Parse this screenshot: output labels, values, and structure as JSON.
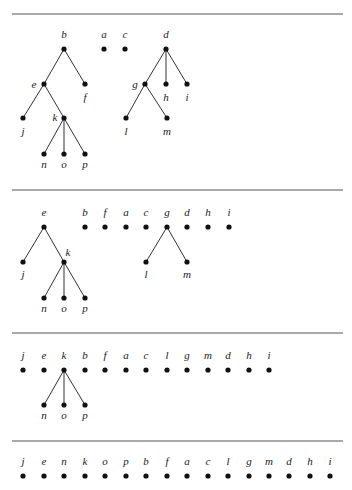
{
  "diagram": {
    "type": "forest-flattening-sequence",
    "node_radius": 2.6,
    "rules": [
      14,
      190,
      333,
      441
    ],
    "panels": [
      {
        "id": "panel-1",
        "nodes": [
          {
            "id": "b",
            "x": 64,
            "y": 49,
            "lx": 64,
            "ly": 38
          },
          {
            "id": "a",
            "x": 104,
            "y": 49,
            "lx": 104,
            "ly": 38
          },
          {
            "id": "c",
            "x": 125,
            "y": 49,
            "lx": 125,
            "ly": 38
          },
          {
            "id": "d",
            "x": 166,
            "y": 49,
            "lx": 166,
            "ly": 38
          },
          {
            "id": "e",
            "x": 44,
            "y": 84,
            "lx": 34,
            "ly": 88
          },
          {
            "id": "f",
            "x": 85,
            "y": 84,
            "lx": 85,
            "ly": 101
          },
          {
            "id": "g",
            "x": 145,
            "y": 84,
            "lx": 135,
            "ly": 88
          },
          {
            "id": "h",
            "x": 166,
            "y": 84,
            "lx": 166,
            "ly": 101
          },
          {
            "id": "i",
            "x": 187,
            "y": 84,
            "lx": 187,
            "ly": 101
          },
          {
            "id": "j",
            "x": 23,
            "y": 118,
            "lx": 23,
            "ly": 135
          },
          {
            "id": "k",
            "x": 64,
            "y": 118,
            "lx": 55,
            "ly": 121
          },
          {
            "id": "l",
            "x": 126,
            "y": 118,
            "lx": 126,
            "ly": 135
          },
          {
            "id": "m",
            "x": 167,
            "y": 118,
            "lx": 167,
            "ly": 135
          },
          {
            "id": "n",
            "x": 44,
            "y": 154,
            "lx": 44,
            "ly": 168
          },
          {
            "id": "o",
            "x": 64,
            "y": 154,
            "lx": 64,
            "ly": 168
          },
          {
            "id": "p",
            "x": 85,
            "y": 154,
            "lx": 85,
            "ly": 168
          }
        ],
        "edges": [
          [
            "b",
            "e"
          ],
          [
            "b",
            "f"
          ],
          [
            "e",
            "j"
          ],
          [
            "e",
            "k"
          ],
          [
            "k",
            "n"
          ],
          [
            "k",
            "o"
          ],
          [
            "k",
            "p"
          ],
          [
            "d",
            "g"
          ],
          [
            "d",
            "h"
          ],
          [
            "d",
            "i"
          ],
          [
            "g",
            "l"
          ],
          [
            "g",
            "m"
          ]
        ]
      },
      {
        "id": "panel-2",
        "nodes": [
          {
            "id": "e",
            "x": 44,
            "y": 227,
            "lx": 44,
            "ly": 216
          },
          {
            "id": "b",
            "x": 85,
            "y": 227,
            "lx": 85,
            "ly": 216
          },
          {
            "id": "f",
            "x": 105,
            "y": 227,
            "lx": 105,
            "ly": 216
          },
          {
            "id": "a",
            "x": 126,
            "y": 227,
            "lx": 126,
            "ly": 216
          },
          {
            "id": "c",
            "x": 146,
            "y": 227,
            "lx": 146,
            "ly": 216
          },
          {
            "id": "g",
            "x": 167,
            "y": 227,
            "lx": 167,
            "ly": 216
          },
          {
            "id": "d",
            "x": 187,
            "y": 227,
            "lx": 187,
            "ly": 216
          },
          {
            "id": "h",
            "x": 208,
            "y": 227,
            "lx": 208,
            "ly": 216
          },
          {
            "id": "i",
            "x": 229,
            "y": 227,
            "lx": 229,
            "ly": 216
          },
          {
            "id": "j",
            "x": 23,
            "y": 262,
            "lx": 23,
            "ly": 278
          },
          {
            "id": "k",
            "x": 64,
            "y": 262,
            "lx": 68,
            "ly": 256
          },
          {
            "id": "l",
            "x": 146,
            "y": 262,
            "lx": 146,
            "ly": 278
          },
          {
            "id": "m",
            "x": 187,
            "y": 262,
            "lx": 187,
            "ly": 278
          },
          {
            "id": "n",
            "x": 44,
            "y": 298,
            "lx": 44,
            "ly": 312
          },
          {
            "id": "o",
            "x": 64,
            "y": 298,
            "lx": 64,
            "ly": 312
          },
          {
            "id": "p",
            "x": 85,
            "y": 298,
            "lx": 85,
            "ly": 312
          }
        ],
        "edges": [
          [
            "e",
            "j"
          ],
          [
            "e",
            "k"
          ],
          [
            "k",
            "n"
          ],
          [
            "k",
            "o"
          ],
          [
            "k",
            "p"
          ],
          [
            "g",
            "l"
          ],
          [
            "g",
            "m"
          ]
        ]
      },
      {
        "id": "panel-3",
        "nodes": [
          {
            "id": "j",
            "x": 23,
            "y": 370,
            "lx": 23,
            "ly": 359
          },
          {
            "id": "e",
            "x": 44,
            "y": 370,
            "lx": 44,
            "ly": 359
          },
          {
            "id": "k",
            "x": 64,
            "y": 370,
            "lx": 64,
            "ly": 359
          },
          {
            "id": "b",
            "x": 85,
            "y": 370,
            "lx": 85,
            "ly": 359
          },
          {
            "id": "f",
            "x": 105,
            "y": 370,
            "lx": 105,
            "ly": 359
          },
          {
            "id": "a",
            "x": 126,
            "y": 370,
            "lx": 126,
            "ly": 359
          },
          {
            "id": "c",
            "x": 146,
            "y": 370,
            "lx": 146,
            "ly": 359
          },
          {
            "id": "l",
            "x": 167,
            "y": 370,
            "lx": 167,
            "ly": 359
          },
          {
            "id": "g",
            "x": 187,
            "y": 370,
            "lx": 187,
            "ly": 359
          },
          {
            "id": "m",
            "x": 208,
            "y": 370,
            "lx": 208,
            "ly": 359
          },
          {
            "id": "d",
            "x": 228,
            "y": 370,
            "lx": 228,
            "ly": 359
          },
          {
            "id": "h",
            "x": 249,
            "y": 370,
            "lx": 249,
            "ly": 359
          },
          {
            "id": "i",
            "x": 269,
            "y": 370,
            "lx": 269,
            "ly": 359
          },
          {
            "id": "n",
            "x": 44,
            "y": 405,
            "lx": 44,
            "ly": 419
          },
          {
            "id": "o",
            "x": 64,
            "y": 405,
            "lx": 64,
            "ly": 419
          },
          {
            "id": "p",
            "x": 85,
            "y": 405,
            "lx": 85,
            "ly": 419
          }
        ],
        "edges": [
          [
            "k",
            "n"
          ],
          [
            "k",
            "o"
          ],
          [
            "k",
            "p"
          ]
        ]
      },
      {
        "id": "panel-4",
        "nodes": [
          {
            "id": "j",
            "x": 23,
            "y": 476,
            "lx": 23,
            "ly": 465
          },
          {
            "id": "e",
            "x": 44,
            "y": 476,
            "lx": 44,
            "ly": 465
          },
          {
            "id": "n",
            "x": 64,
            "y": 476,
            "lx": 64,
            "ly": 465
          },
          {
            "id": "k",
            "x": 85,
            "y": 476,
            "lx": 85,
            "ly": 465
          },
          {
            "id": "o",
            "x": 105,
            "y": 476,
            "lx": 105,
            "ly": 465
          },
          {
            "id": "p",
            "x": 126,
            "y": 476,
            "lx": 126,
            "ly": 465
          },
          {
            "id": "b",
            "x": 146,
            "y": 476,
            "lx": 146,
            "ly": 465
          },
          {
            "id": "f",
            "x": 167,
            "y": 476,
            "lx": 167,
            "ly": 465
          },
          {
            "id": "a",
            "x": 187,
            "y": 476,
            "lx": 187,
            "ly": 465
          },
          {
            "id": "c",
            "x": 208,
            "y": 476,
            "lx": 208,
            "ly": 465
          },
          {
            "id": "l",
            "x": 228,
            "y": 476,
            "lx": 228,
            "ly": 465
          },
          {
            "id": "g",
            "x": 249,
            "y": 476,
            "lx": 249,
            "ly": 465
          },
          {
            "id": "m",
            "x": 269,
            "y": 476,
            "lx": 269,
            "ly": 465
          },
          {
            "id": "d",
            "x": 289,
            "y": 476,
            "lx": 289,
            "ly": 465
          },
          {
            "id": "h",
            "x": 310,
            "y": 476,
            "lx": 310,
            "ly": 465
          },
          {
            "id": "i",
            "x": 330,
            "y": 476,
            "lx": 330,
            "ly": 465
          }
        ],
        "edges": []
      }
    ]
  }
}
